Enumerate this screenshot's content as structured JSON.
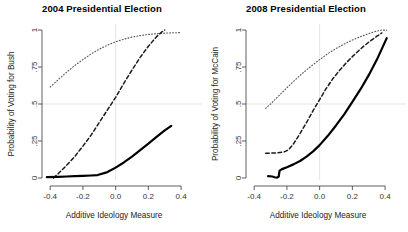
{
  "figure": {
    "background": "#ffffff",
    "panel_count": 2
  },
  "panels": [
    {
      "title": "2004 Presidential Election",
      "xlabel": "Additive Ideology Measure",
      "ylabel": "Probability of Voting for Bush"
    },
    {
      "title": "2008 Presidential Election",
      "xlabel": "Additive Ideology Measure",
      "ylabel": "Probability of Voting for McCain"
    }
  ],
  "axis": {
    "xticks": [
      "-0.4",
      "-0.2",
      "0.0",
      "0.2",
      "0.4"
    ],
    "yticks": [
      "0",
      ".25",
      ".5",
      ".75",
      "1"
    ]
  },
  "chart_data": [
    {
      "type": "line",
      "title": "2004 Presidential Election",
      "xlabel": "Additive Ideology Measure",
      "ylabel": "Probability of Voting for Bush",
      "xlim": [
        -0.45,
        0.43
      ],
      "ylim": [
        0,
        1
      ],
      "xticks": [
        -0.4,
        -0.2,
        0.0,
        0.2,
        0.4
      ],
      "yticks": [
        0,
        0.25,
        0.5,
        0.75,
        1
      ],
      "xticklabels": [
        "-0.4",
        "-0.2",
        "0.0",
        "0.2",
        "0.4"
      ],
      "yticklabels": [
        "0",
        ".25",
        ".5",
        ".75",
        "1"
      ],
      "grid": false,
      "reference_lines": {
        "horizontal": [
          0.5
        ],
        "vertical": [
          0.0
        ],
        "color": "#d9d9d9"
      },
      "legend": "none",
      "series": [
        {
          "name": "dotted-upper",
          "style": "dotted",
          "color": "#555555",
          "width": 1.1,
          "x": [
            -0.4,
            -0.35,
            -0.3,
            -0.25,
            -0.2,
            -0.15,
            -0.1,
            -0.05,
            0.0,
            0.05,
            0.1,
            0.15,
            0.2,
            0.25,
            0.3,
            0.35,
            0.4
          ],
          "y": [
            0.615,
            0.665,
            0.715,
            0.76,
            0.8,
            0.838,
            0.87,
            0.898,
            0.92,
            0.938,
            0.952,
            0.962,
            0.97,
            0.975,
            0.979,
            0.981,
            0.983
          ]
        },
        {
          "name": "dashed-middle",
          "style": "dashed",
          "color": "#1a1a1a",
          "width": 1.5,
          "x": [
            -0.38,
            -0.35,
            -0.3,
            -0.25,
            -0.2,
            -0.15,
            -0.1,
            -0.05,
            0.0,
            0.05,
            0.1,
            0.15,
            0.2,
            0.25,
            0.28,
            0.3
          ],
          "y": [
            0.0,
            0.03,
            0.085,
            0.145,
            0.215,
            0.29,
            0.375,
            0.46,
            0.545,
            0.64,
            0.73,
            0.815,
            0.89,
            0.955,
            0.985,
            1.0
          ]
        },
        {
          "name": "solid-lower",
          "style": "solid",
          "color": "#000000",
          "width": 2.2,
          "x": [
            -0.42,
            -0.35,
            -0.3,
            -0.25,
            -0.2,
            -0.15,
            -0.11,
            -0.05,
            0.0,
            0.05,
            0.1,
            0.15,
            0.2,
            0.25,
            0.3,
            0.34
          ],
          "y": [
            0.006,
            0.008,
            0.01,
            0.012,
            0.014,
            0.017,
            0.02,
            0.04,
            0.07,
            0.105,
            0.145,
            0.188,
            0.232,
            0.278,
            0.322,
            0.352
          ]
        }
      ]
    },
    {
      "type": "line",
      "title": "2008 Presidential Election",
      "xlabel": "Additive Ideology Measure",
      "ylabel": "Probability of Voting for McCain",
      "xlim": [
        -0.45,
        0.43
      ],
      "ylim": [
        0,
        1
      ],
      "xticks": [
        -0.4,
        -0.2,
        0.0,
        0.2,
        0.4
      ],
      "yticks": [
        0,
        0.25,
        0.5,
        0.75,
        1
      ],
      "xticklabels": [
        "-0.4",
        "-0.2",
        "0.0",
        "0.2",
        "0.4"
      ],
      "yticklabels": [
        "0",
        ".25",
        ".5",
        ".75",
        "1"
      ],
      "grid": false,
      "reference_lines": {
        "horizontal": [
          0.5
        ],
        "vertical": [
          0.0
        ],
        "color": "#d9d9d9"
      },
      "legend": "none",
      "series": [
        {
          "name": "dotted-upper",
          "style": "dotted",
          "color": "#555555",
          "width": 1.1,
          "x": [
            -0.33,
            -0.3,
            -0.25,
            -0.2,
            -0.15,
            -0.1,
            -0.05,
            0.0,
            0.05,
            0.1,
            0.15,
            0.2,
            0.25,
            0.3,
            0.34,
            0.38,
            0.41
          ],
          "y": [
            0.47,
            0.5,
            0.555,
            0.61,
            0.663,
            0.712,
            0.757,
            0.8,
            0.84,
            0.875,
            0.905,
            0.932,
            0.955,
            0.975,
            0.99,
            1.0,
            0.998
          ]
        },
        {
          "name": "dashed-middle",
          "style": "dashed",
          "color": "#1a1a1a",
          "width": 1.5,
          "x": [
            -0.33,
            -0.3,
            -0.26,
            -0.22,
            -0.19,
            -0.16,
            -0.12,
            -0.08,
            -0.04,
            0.0,
            0.04,
            0.08,
            0.12,
            0.16,
            0.2,
            0.25,
            0.3,
            0.35,
            0.38
          ],
          "y": [
            0.168,
            0.168,
            0.17,
            0.175,
            0.19,
            0.23,
            0.3,
            0.375,
            0.455,
            0.53,
            0.605,
            0.67,
            0.725,
            0.775,
            0.82,
            0.872,
            0.918,
            0.958,
            0.98
          ]
        },
        {
          "name": "solid-lower",
          "style": "solid",
          "color": "#000000",
          "width": 2.2,
          "x": [
            -0.315,
            -0.29,
            -0.275,
            -0.26,
            -0.25,
            -0.245,
            -0.23,
            -0.2,
            -0.16,
            -0.12,
            -0.08,
            -0.04,
            0.0,
            0.05,
            0.1,
            0.15,
            0.2,
            0.25,
            0.3,
            0.35,
            0.41
          ],
          "y": [
            0.012,
            0.01,
            0.005,
            0.003,
            0.01,
            0.05,
            0.06,
            0.073,
            0.092,
            0.115,
            0.145,
            0.18,
            0.222,
            0.285,
            0.355,
            0.43,
            0.515,
            0.6,
            0.695,
            0.8,
            0.945
          ]
        }
      ]
    }
  ]
}
